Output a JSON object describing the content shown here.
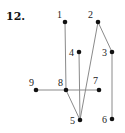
{
  "problem": {
    "number": "12."
  },
  "graph": {
    "nodes": [
      {
        "id": "1",
        "label": "1",
        "x": 65,
        "y": 22,
        "lx": 57,
        "ly": 18
      },
      {
        "id": "2",
        "label": "2",
        "x": 98,
        "y": 22,
        "lx": 88,
        "ly": 18
      },
      {
        "id": "3",
        "label": "3",
        "x": 112,
        "y": 52,
        "lx": 102,
        "ly": 56
      },
      {
        "id": "4",
        "label": "4",
        "x": 79,
        "y": 52,
        "lx": 69,
        "ly": 56
      },
      {
        "id": "5",
        "label": "5",
        "x": 80,
        "y": 120,
        "lx": 70,
        "ly": 124
      },
      {
        "id": "6",
        "label": "6",
        "x": 112,
        "y": 119,
        "lx": 102,
        "ly": 123
      },
      {
        "id": "7",
        "label": "7",
        "x": 99,
        "y": 90,
        "lx": 93,
        "ly": 84
      },
      {
        "id": "8",
        "label": "8",
        "x": 66,
        "y": 90,
        "lx": 58,
        "ly": 86
      },
      {
        "id": "9",
        "label": "9",
        "x": 36,
        "y": 90,
        "lx": 29,
        "ly": 86
      }
    ],
    "edges": [
      [
        "1",
        "8"
      ],
      [
        "2",
        "5"
      ],
      [
        "2",
        "3"
      ],
      [
        "4",
        "5"
      ],
      [
        "3",
        "6"
      ],
      [
        "9",
        "8"
      ],
      [
        "8",
        "7"
      ],
      [
        "8",
        "5"
      ]
    ]
  }
}
